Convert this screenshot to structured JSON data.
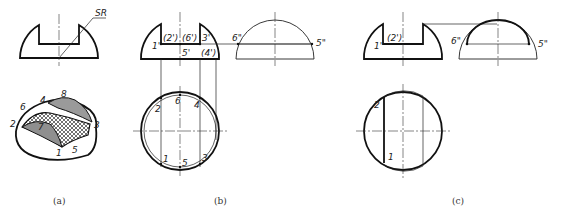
{
  "figure": {
    "panels": [
      {
        "id": "a",
        "caption": "(a)",
        "front_view": {
          "dimension_label": "SR"
        },
        "isometric_labels": [
          "1",
          "2",
          "3",
          "4",
          "5",
          "6",
          "7",
          "8"
        ]
      },
      {
        "id": "b",
        "caption": "(b)",
        "front_view_labels": {
          "p1": "1'",
          "p2": "(2')",
          "p6": "(6')",
          "p3": "3'",
          "p5": "5'",
          "p4": "(4')"
        },
        "side_view_labels": {
          "p6": "6\"",
          "p5": "5\""
        },
        "top_view_labels": {
          "p2": "2",
          "p6": "6",
          "p4": "4",
          "p1": "1",
          "p5": "5",
          "p3": "3"
        }
      },
      {
        "id": "c",
        "caption": "(c)",
        "front_view_labels": {
          "p1": "1'",
          "p2": "(2')"
        },
        "side_view_labels": {
          "p6": "6\"",
          "p5": "5\""
        },
        "top_view_labels": {
          "p2": "2",
          "p1": "1"
        }
      }
    ]
  }
}
